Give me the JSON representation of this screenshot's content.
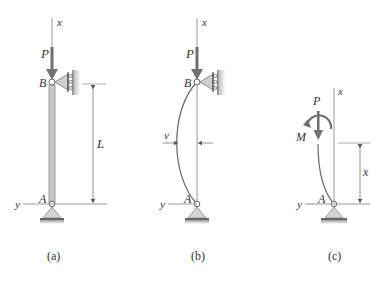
{
  "figure": {
    "panels": [
      {
        "id": "a",
        "caption": "(a)",
        "labels": {
          "axis_x": "x",
          "axis_y": "y",
          "load": "P",
          "top_pin": "B",
          "bottom_pin": "A",
          "length": "L"
        }
      },
      {
        "id": "b",
        "caption": "(b)",
        "labels": {
          "axis_x": "x",
          "axis_y": "y",
          "load": "P",
          "top_pin": "B",
          "bottom_pin": "A",
          "deflection": "v"
        }
      },
      {
        "id": "c",
        "caption": "(c)",
        "labels": {
          "axis_x": "x",
          "axis_y": "y",
          "load": "P",
          "moment": "M",
          "bottom_pin": "A",
          "distance": "x"
        }
      }
    ],
    "colors": {
      "line": "#555555",
      "column_fill": "#c8c8c8",
      "column_edge": "#8a8a8a",
      "support_fill": "#d4d4d4",
      "ground": "#777777",
      "arrow": "#666666",
      "text": "#333333"
    }
  }
}
